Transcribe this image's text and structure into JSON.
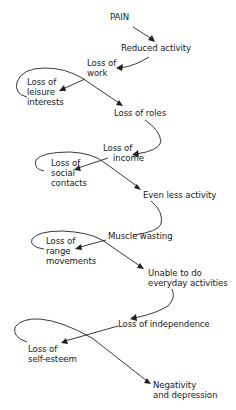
{
  "diagram": {
    "type": "flow-cycle",
    "nodes": [
      {
        "id": "pain",
        "lines": [
          "PAIN"
        ]
      },
      {
        "id": "reduced-activity",
        "lines": [
          "Reduced activity"
        ]
      },
      {
        "id": "loss-of-work",
        "lines": [
          "Loss of",
          "work"
        ]
      },
      {
        "id": "loss-of-leisure",
        "lines": [
          "Loss of",
          "leisure",
          "interests"
        ]
      },
      {
        "id": "loss-of-roles",
        "lines": [
          "Loss of roles"
        ]
      },
      {
        "id": "loss-of-income",
        "lines": [
          "Loss of",
          "income"
        ]
      },
      {
        "id": "loss-of-social",
        "lines": [
          "Loss of",
          "social",
          "contacts"
        ]
      },
      {
        "id": "even-less-activity",
        "lines": [
          "Even less activity"
        ]
      },
      {
        "id": "muscle-wasting",
        "lines": [
          "Muscle wasting"
        ]
      },
      {
        "id": "loss-of-range",
        "lines": [
          "Loss of",
          "range",
          "movements"
        ]
      },
      {
        "id": "unable-everyday",
        "lines": [
          "Unable to do",
          "everyday activities"
        ]
      },
      {
        "id": "loss-of-independence",
        "lines": [
          "Loss of independence"
        ]
      },
      {
        "id": "loss-of-self-esteem",
        "lines": [
          "Loss of",
          "self-esteem"
        ]
      },
      {
        "id": "negativity",
        "lines": [
          "Negativity",
          "and depression"
        ]
      }
    ],
    "edges": [
      [
        "pain",
        "reduced-activity"
      ],
      [
        "reduced-activity",
        "loss-of-work"
      ],
      [
        "loss-of-work",
        "loss-of-leisure"
      ],
      [
        "loss-of-leisure",
        "loss-of-roles"
      ],
      [
        "loss-of-roles",
        "loss-of-income"
      ],
      [
        "loss-of-income",
        "loss-of-social"
      ],
      [
        "loss-of-social",
        "even-less-activity"
      ],
      [
        "even-less-activity",
        "muscle-wasting"
      ],
      [
        "muscle-wasting",
        "loss-of-range"
      ],
      [
        "loss-of-range",
        "unable-everyday"
      ],
      [
        "unable-everyday",
        "loss-of-independence"
      ],
      [
        "loss-of-independence",
        "loss-of-self-esteem"
      ],
      [
        "loss-of-self-esteem",
        "negativity"
      ]
    ]
  }
}
